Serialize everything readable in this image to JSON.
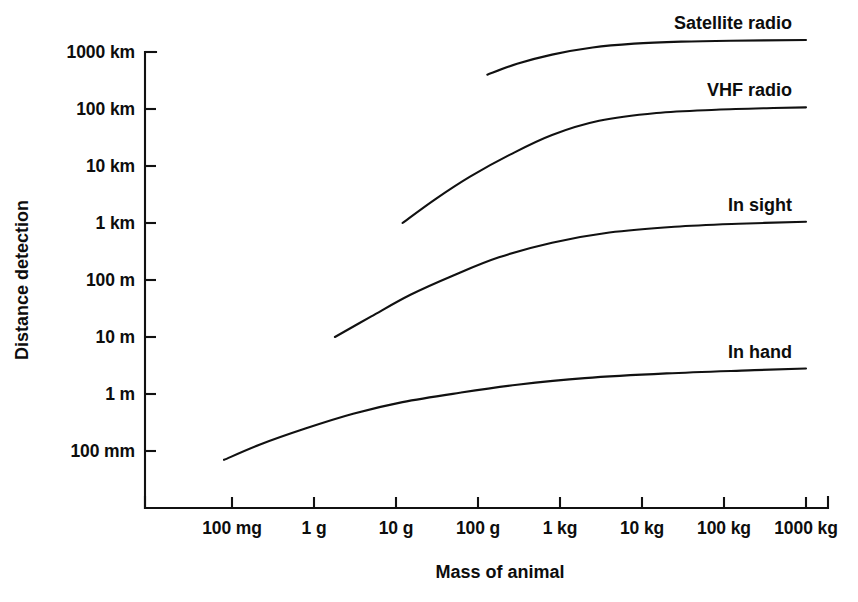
{
  "chart_data": {
    "type": "line",
    "title": "",
    "subtitle": "",
    "xlabel": "Mass of animal",
    "ylabel": "Distance detection",
    "x_scale": "log",
    "y_scale": "log",
    "grid": false,
    "legend_position": "inline-right-of-curve",
    "x_tick_labels": [
      "100 mg",
      "1 g",
      "10 g",
      "100 g",
      "1 kg",
      "10 kg",
      "100 kg",
      "1000 kg"
    ],
    "x_tick_values_kg": [
      0.0001,
      0.001,
      0.01,
      0.1,
      1,
      10,
      100,
      1000
    ],
    "y_tick_labels": [
      "1000 km",
      "100 km",
      "10 km",
      "1 km",
      "100 m",
      "10 m",
      "1 m",
      "100 mm"
    ],
    "y_tick_values_m": [
      1000000,
      100000,
      10000,
      1000,
      100,
      10,
      1,
      0.1
    ],
    "xlim_kg": [
      0.0001,
      1000
    ],
    "ylim_m": [
      0.1,
      1000000
    ],
    "series": [
      {
        "name": "In hand",
        "label": "In hand",
        "color": "#111111",
        "points": [
          {
            "x_kg": 8e-05,
            "y_m": 0.07
          },
          {
            "x_kg": 0.00022,
            "y_m": 0.13
          },
          {
            "x_kg": 0.0008,
            "y_m": 0.25
          },
          {
            "x_kg": 0.003,
            "y_m": 0.45
          },
          {
            "x_kg": 0.012,
            "y_m": 0.72
          },
          {
            "x_kg": 0.06,
            "y_m": 1.05
          },
          {
            "x_kg": 0.3,
            "y_m": 1.45
          },
          {
            "x_kg": 2.0,
            "y_m": 1.9
          },
          {
            "x_kg": 20,
            "y_m": 2.3
          },
          {
            "x_kg": 200,
            "y_m": 2.6
          },
          {
            "x_kg": 1000,
            "y_m": 2.8
          }
        ]
      },
      {
        "name": "In sight",
        "label": "In sight",
        "color": "#111111",
        "points": [
          {
            "x_kg": 0.0018,
            "y_m": 10
          },
          {
            "x_kg": 0.005,
            "y_m": 23
          },
          {
            "x_kg": 0.015,
            "y_m": 55
          },
          {
            "x_kg": 0.05,
            "y_m": 120
          },
          {
            "x_kg": 0.18,
            "y_m": 250
          },
          {
            "x_kg": 0.8,
            "y_m": 450
          },
          {
            "x_kg": 4,
            "y_m": 680
          },
          {
            "x_kg": 25,
            "y_m": 860
          },
          {
            "x_kg": 150,
            "y_m": 970
          },
          {
            "x_kg": 1000,
            "y_m": 1050
          }
        ]
      },
      {
        "name": "VHF radio",
        "label": "VHF radio",
        "color": "#111111",
        "points": [
          {
            "x_kg": 0.012,
            "y_m": 1000
          },
          {
            "x_kg": 0.03,
            "y_m": 2600
          },
          {
            "x_kg": 0.08,
            "y_m": 6500
          },
          {
            "x_kg": 0.25,
            "y_m": 16000
          },
          {
            "x_kg": 0.8,
            "y_m": 35000
          },
          {
            "x_kg": 3,
            "y_m": 62000
          },
          {
            "x_kg": 15,
            "y_m": 85000
          },
          {
            "x_kg": 80,
            "y_m": 97000
          },
          {
            "x_kg": 400,
            "y_m": 104000
          },
          {
            "x_kg": 1000,
            "y_m": 107000
          }
        ]
      },
      {
        "name": "Satellite radio",
        "label": "Satellite radio",
        "color": "#111111",
        "points": [
          {
            "x_kg": 0.13,
            "y_m": 400000
          },
          {
            "x_kg": 0.3,
            "y_m": 620000
          },
          {
            "x_kg": 0.8,
            "y_m": 900000
          },
          {
            "x_kg": 2.5,
            "y_m": 1200000
          },
          {
            "x_kg": 8,
            "y_m": 1400000
          },
          {
            "x_kg": 30,
            "y_m": 1520000
          },
          {
            "x_kg": 120,
            "y_m": 1580000
          },
          {
            "x_kg": 1000,
            "y_m": 1620000
          }
        ]
      }
    ]
  },
  "geometry": {
    "x_pixel_of_first_tick": 232,
    "x_pixels_per_decade": 82,
    "y_pixel_of_top_tick": 52,
    "y_pixels_per_decade": 57,
    "axis_x": 145,
    "axis_y_bottom": 508,
    "axis_x_right": 828,
    "axis_y_top": 52,
    "curve_right_end_x": 808
  },
  "labels": {
    "satellite_radio": "Satellite radio",
    "vhf_radio": "VHF radio",
    "in_sight": "In sight",
    "in_hand": "In hand"
  }
}
